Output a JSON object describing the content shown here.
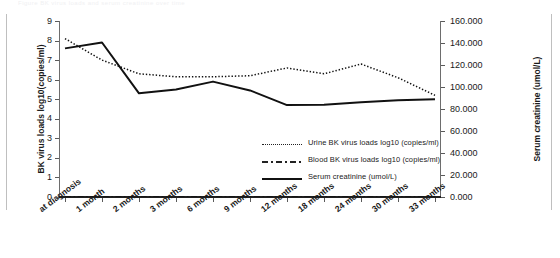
{
  "figure": {
    "top_clipped_text": "Figure  BK virus loads and serum creatinine over time",
    "left_axis_title": "BK virus loads log10(copies/ml)",
    "right_axis_title": "Serum creatinine (umol/L)"
  },
  "legend": {
    "position": "inside-right-middle",
    "items": [
      {
        "label": "Urine  BK virus loads log10 (copies/ml)",
        "style": "dotted",
        "name": "urine-series"
      },
      {
        "label": "Blood  BK virus loads log10 (copies/ml)",
        "style": "dash-dot",
        "name": "blood-series"
      },
      {
        "label": "Serum creatinine (umol/L)",
        "style": "solid",
        "name": "creatinine-series"
      }
    ]
  },
  "chart_data": {
    "type": "line",
    "title": "",
    "xlabel": "",
    "ylabel": "BK virus loads log10(copies/ml)",
    "y2label": "Serum creatinine (umol/L)",
    "grid": false,
    "legend_position": "center-right",
    "categories": [
      "at diagnosis",
      "1 month",
      "2 months",
      "3 months",
      "6 months",
      "9 months",
      "12 months",
      "18 months",
      "24 months",
      "30 months",
      "33 months"
    ],
    "ylim": [
      0,
      9
    ],
    "yticks": [
      0,
      1,
      2,
      3,
      4,
      5,
      6,
      7,
      8,
      9
    ],
    "ytick_labels": [
      "0",
      "1",
      "2",
      "3",
      "4",
      "5",
      "6",
      "7",
      "8",
      "9"
    ],
    "y2lim": [
      0,
      160
    ],
    "y2ticks": [
      0,
      20,
      40,
      60,
      80,
      100,
      120,
      140,
      160
    ],
    "y2tick_labels": [
      "0.000",
      "20.000",
      "40.000",
      "60.000",
      "80.000",
      "100.000",
      "120.000",
      "140.000",
      "160.000"
    ],
    "series": [
      {
        "name": "Urine  BK virus loads log10 (copies/ml)",
        "axis": "left",
        "style": "dotted",
        "values": [
          8.1,
          7.0,
          6.3,
          6.15,
          6.15,
          6.2,
          6.6,
          6.3,
          6.8,
          6.1,
          5.2
        ]
      },
      {
        "name": "Blood  BK virus loads log10 (copies/ml)",
        "axis": "left",
        "style": "dash-dot",
        "values": [
          0.0,
          0.0,
          0.0,
          0.0,
          0.0,
          0.0,
          0.0,
          0.0,
          0.0,
          0.0,
          0.0
        ]
      },
      {
        "name": "Serum creatinine (umol/L)",
        "axis": "right",
        "style": "solid",
        "values": [
          135,
          140,
          94,
          98,
          105,
          97,
          84,
          84,
          86,
          88,
          89
        ],
        "values_as_plotted_left_scale": [
          7.6,
          7.9,
          5.3,
          5.5,
          5.9,
          5.45,
          4.7,
          4.72,
          4.85,
          4.95,
          5.0
        ]
      }
    ]
  }
}
